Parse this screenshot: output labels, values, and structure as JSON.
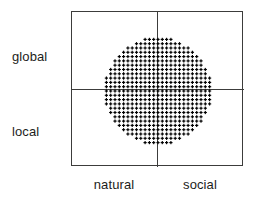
{
  "figure": {
    "type": "quadrant-scatter-diagram",
    "background_color": "#ffffff",
    "line_color": "#3c3c3b",
    "dot_color": "#000000"
  },
  "axes": {
    "y_labels": [
      {
        "id": "global",
        "text": "global",
        "position": "upper-left"
      },
      {
        "id": "local",
        "text": "local",
        "position": "lower-left"
      }
    ],
    "x_labels": [
      {
        "id": "natural",
        "text": "natural",
        "position": "bottom-left"
      },
      {
        "id": "social",
        "text": "social",
        "position": "bottom-right"
      }
    ]
  },
  "chart_data": {
    "type": "scatter",
    "title": "",
    "xlabel": "",
    "ylabel": "",
    "categories": [
      "natural",
      "social"
    ],
    "row_categories": [
      "global",
      "local"
    ],
    "quadrants": [
      {
        "x": "natural",
        "y": "global"
      },
      {
        "x": "social",
        "y": "global"
      },
      {
        "x": "natural",
        "y": "local"
      },
      {
        "x": "social",
        "y": "local"
      }
    ],
    "grid": true,
    "legend": "none",
    "cloud": {
      "shape": "circle",
      "center_x": 86,
      "center_y": 79,
      "radius": 53,
      "spacing": 4.3,
      "marker": "plus",
      "marker_size": 3.2,
      "description": "Uniform dense lattice of plus-shaped markers filling a circle centered on the crosshair intersection, spanning all four quadrants"
    },
    "frame": {
      "x": 71,
      "y": 11,
      "width": 172,
      "height": 155,
      "divider_x": 85,
      "divider_y": 77
    }
  }
}
